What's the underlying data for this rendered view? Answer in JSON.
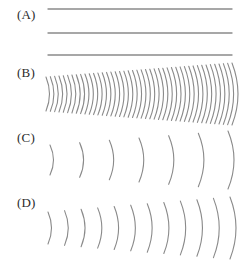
{
  "figure": {
    "width": 247,
    "height": 262,
    "background": "#ffffff",
    "stroke_color": "#8a8a8a",
    "label_color": "#2b2b2b"
  },
  "panels": [
    {
      "id": "A",
      "label": "(A)",
      "label_x": 17,
      "label_y": 8,
      "top": 0,
      "height": 62,
      "type": "straight-lines",
      "stroke_width": 1.3,
      "lines": [
        {
          "x1": 48,
          "y1": 9,
          "x2": 232,
          "y2": 9
        },
        {
          "x1": 48,
          "y1": 33,
          "x2": 232,
          "y2": 33
        },
        {
          "x1": 48,
          "y1": 55,
          "x2": 232,
          "y2": 55
        }
      ]
    },
    {
      "id": "B",
      "label": "(B)",
      "label_x": 17,
      "label_y": 66,
      "top": 62,
      "height": 64,
      "type": "arcs",
      "stroke_width": 1.1,
      "count": 44,
      "x_start": 46,
      "x_end": 232,
      "center_y": 32,
      "half_height_start": 17,
      "half_height_end": 31,
      "bulge_start": 7,
      "bulge_end": 12
    },
    {
      "id": "C",
      "label": "(C)",
      "label_x": 17,
      "label_y": 131,
      "top": 126,
      "height": 66,
      "type": "arcs",
      "stroke_width": 1.1,
      "count": 7,
      "x_start": 50,
      "x_end": 228,
      "center_y": 34,
      "half_height_start": 15,
      "half_height_end": 29,
      "bulge_start": 7,
      "bulge_end": 12
    },
    {
      "id": "D",
      "label": "(D)",
      "label_x": 17,
      "label_y": 196,
      "top": 192,
      "height": 70,
      "type": "arcs",
      "stroke_width": 1.1,
      "count": 12,
      "x_start": 48,
      "x_end": 230,
      "center_y": 36,
      "half_height_start": 16,
      "half_height_end": 31,
      "bulge_start": 7,
      "bulge_end": 12
    }
  ]
}
